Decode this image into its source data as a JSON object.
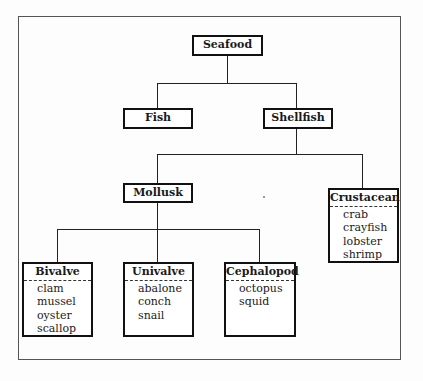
{
  "diagram": {
    "type": "hierarchy",
    "root": {
      "label": "Seafood",
      "children": [
        {
          "label": "Fish"
        },
        {
          "label": "Shellfish",
          "children": [
            {
              "label": "Mollusk",
              "children": [
                {
                  "label": "Bivalve",
                  "items": [
                    "clam",
                    "mussel",
                    "oyster",
                    "scallop"
                  ]
                },
                {
                  "label": "Univalve",
                  "items": [
                    "abalone",
                    "conch",
                    "snail"
                  ]
                },
                {
                  "label": "Cephalopod",
                  "items": [
                    "octopus",
                    "squid"
                  ]
                }
              ]
            },
            {
              "label": "Crustacean",
              "items": [
                "crab",
                "crayfish",
                "lobster",
                "shrimp"
              ]
            }
          ]
        }
      ]
    }
  },
  "nodes": {
    "seafood": "Seafood",
    "fish": "Fish",
    "shellfish": "Shellfish",
    "mollusk": "Mollusk",
    "crustacean": {
      "title": "Crustacean",
      "items": [
        "crab",
        "crayfish",
        "lobster",
        "shrimp"
      ]
    },
    "bivalve": {
      "title": "Bivalve",
      "items": [
        "clam",
        "mussel",
        "oyster",
        "scallop"
      ]
    },
    "univalve": {
      "title": "Univalve",
      "items": [
        "abalone",
        "conch",
        "snail"
      ]
    },
    "cephalopod": {
      "title": "Cephalopod",
      "items": [
        "octopus",
        "squid"
      ]
    }
  }
}
